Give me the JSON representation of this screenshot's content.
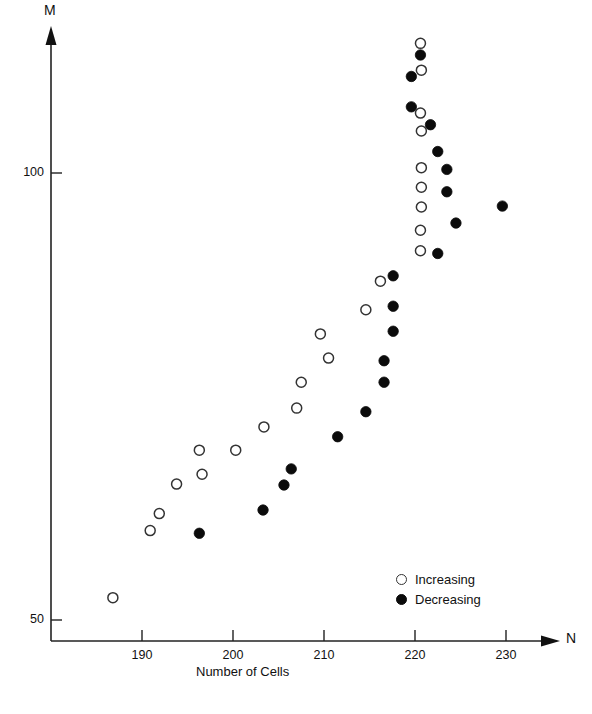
{
  "chart_data": {
    "type": "scatter",
    "title": "",
    "xlabel": "Number of Cells",
    "ylabel": "",
    "x_axis_name": "N",
    "y_axis_name": "M",
    "xlim": [
      184,
      236
    ],
    "ylim": [
      49,
      119
    ],
    "xticks": [
      190,
      200,
      210,
      220,
      230
    ],
    "yticks": [
      50,
      100
    ],
    "xtick_labels": [
      "190",
      "200",
      "210",
      "220",
      "230"
    ],
    "ytick_labels": [
      "50",
      "100"
    ],
    "grid": false,
    "legend_position": "lower-right",
    "series": [
      {
        "name": "Increasing",
        "marker": "open-circle",
        "color": "#ffffff",
        "edge_color": "#333333",
        "points": [
          [
            220.6,
            114.5
          ],
          [
            220.7,
            111.5
          ],
          [
            220.6,
            106.7
          ],
          [
            220.7,
            104.7
          ],
          [
            220.7,
            100.6
          ],
          [
            220.7,
            98.4
          ],
          [
            220.7,
            96.2
          ],
          [
            220.6,
            93.6
          ],
          [
            220.6,
            91.3
          ],
          [
            216.2,
            87.9
          ],
          [
            214.6,
            84.7
          ],
          [
            209.6,
            82.0
          ],
          [
            210.5,
            79.3
          ],
          [
            207.5,
            76.6
          ],
          [
            207.0,
            73.7
          ],
          [
            203.4,
            71.6
          ],
          [
            200.3,
            69.0
          ],
          [
            196.3,
            69.0
          ],
          [
            196.6,
            66.3
          ],
          [
            193.8,
            65.2
          ],
          [
            191.9,
            61.9
          ],
          [
            190.9,
            60.0
          ],
          [
            186.8,
            52.5
          ]
        ]
      },
      {
        "name": "Decreasing",
        "marker": "filled-circle",
        "color": "#0b0b0b",
        "edge_color": "#0b0b0b",
        "points": [
          [
            220.6,
            113.2
          ],
          [
            219.6,
            110.8
          ],
          [
            219.6,
            107.4
          ],
          [
            221.7,
            105.4
          ],
          [
            222.5,
            102.4
          ],
          [
            223.5,
            100.4
          ],
          [
            223.5,
            97.9
          ],
          [
            224.5,
            94.4
          ],
          [
            229.6,
            96.3
          ],
          [
            222.5,
            91.0
          ],
          [
            217.6,
            88.5
          ],
          [
            217.6,
            85.1
          ],
          [
            217.6,
            82.3
          ],
          [
            216.6,
            79.0
          ],
          [
            216.6,
            76.6
          ],
          [
            214.6,
            73.3
          ],
          [
            211.5,
            70.5
          ],
          [
            206.4,
            66.9
          ],
          [
            205.6,
            65.1
          ],
          [
            203.3,
            62.3
          ],
          [
            196.3,
            59.7
          ]
        ]
      }
    ]
  },
  "axes": {
    "y_label": "M",
    "x_label": "N",
    "x_title": "Number of Cells",
    "y_tick_100": "100",
    "y_tick_50": "50",
    "x_tick_190": "190",
    "x_tick_200": "200",
    "x_tick_210": "210",
    "x_tick_220": "220",
    "x_tick_230": "230"
  },
  "legend": {
    "increasing_label": "Increasing",
    "decreasing_label": "Decreasing"
  },
  "colors": {
    "axis": "#222222",
    "open_marker_edge": "#333333",
    "filled_marker": "#0b0b0b",
    "text": "#111111"
  }
}
